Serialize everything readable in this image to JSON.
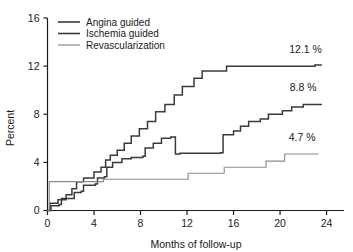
{
  "chart_data": {
    "type": "line",
    "subtype": "step-cumulative-event-curves",
    "title": "",
    "xlabel": "Months of follow-up",
    "ylabel": "Percent",
    "xlim": [
      0,
      25.5
    ],
    "ylim": [
      0,
      16
    ],
    "xticks": [
      0,
      4,
      8,
      12,
      16,
      20,
      24
    ],
    "yticks": [
      0,
      4,
      8,
      12,
      16
    ],
    "xtick_labels": [
      "0",
      "4",
      "8",
      "12",
      "16",
      "20",
      "24"
    ],
    "ytick_labels": [
      "0",
      "4",
      "8",
      "12",
      "16"
    ],
    "grid": false,
    "legend_position": "top-left-inside",
    "series": [
      {
        "name": "Angina guided",
        "color": "#3a3a3a",
        "width": 1.5,
        "endpoint_label": "12.1 %",
        "endpoint_value": 12.1,
        "points": [
          [
            0.0,
            0.0
          ],
          [
            0.2,
            0.6
          ],
          [
            0.9,
            0.9
          ],
          [
            1.6,
            1.3
          ],
          [
            2.1,
            1.8
          ],
          [
            2.5,
            2.4
          ],
          [
            3.1,
            2.7
          ],
          [
            4.0,
            3.2
          ],
          [
            4.6,
            3.6
          ],
          [
            5.0,
            4.2
          ],
          [
            5.4,
            4.6
          ],
          [
            6.0,
            5.0
          ],
          [
            6.6,
            5.6
          ],
          [
            7.2,
            6.2
          ],
          [
            7.9,
            6.8
          ],
          [
            8.6,
            7.4
          ],
          [
            9.3,
            8.2
          ],
          [
            10.1,
            8.8
          ],
          [
            10.9,
            9.6
          ],
          [
            11.6,
            10.3
          ],
          [
            12.6,
            11.0
          ],
          [
            13.3,
            11.6
          ],
          [
            15.3,
            11.6
          ],
          [
            15.4,
            12.0
          ],
          [
            22.6,
            12.0
          ],
          [
            23.0,
            12.1
          ],
          [
            23.6,
            12.1
          ]
        ]
      },
      {
        "name": "Ischemia guided",
        "color": "#3a3a3a",
        "width": 1.5,
        "endpoint_label": "8.8 %",
        "endpoint_value": 8.8,
        "points": [
          [
            0.0,
            0.0
          ],
          [
            0.3,
            0.4
          ],
          [
            1.0,
            0.5
          ],
          [
            1.2,
            1.0
          ],
          [
            2.2,
            1.0
          ],
          [
            2.3,
            1.5
          ],
          [
            2.9,
            1.6
          ],
          [
            3.1,
            2.1
          ],
          [
            4.1,
            2.2
          ],
          [
            4.3,
            2.7
          ],
          [
            4.9,
            2.8
          ],
          [
            5.1,
            3.6
          ],
          [
            5.6,
            4.0
          ],
          [
            6.4,
            4.3
          ],
          [
            7.2,
            4.4
          ],
          [
            8.2,
            4.5
          ],
          [
            8.4,
            5.2
          ],
          [
            9.1,
            5.6
          ],
          [
            9.8,
            6.0
          ],
          [
            10.6,
            6.1
          ],
          [
            11.0,
            4.7
          ],
          [
            11.4,
            4.75
          ],
          [
            14.9,
            4.8
          ],
          [
            15.1,
            6.3
          ],
          [
            16.0,
            6.6
          ],
          [
            16.6,
            7.0
          ],
          [
            17.3,
            7.4
          ],
          [
            18.3,
            7.6
          ],
          [
            19.0,
            8.0
          ],
          [
            20.2,
            8.3
          ],
          [
            21.0,
            8.6
          ],
          [
            22.0,
            8.8
          ],
          [
            23.6,
            8.8
          ]
        ]
      },
      {
        "name": "Revascularization",
        "color": "#8a8a8a",
        "width": 1.1,
        "endpoint_label": "4.7 %",
        "endpoint_value": 4.7,
        "points": [
          [
            0.0,
            0.0
          ],
          [
            0.15,
            2.4
          ],
          [
            4.6,
            2.4
          ],
          [
            4.8,
            2.6
          ],
          [
            9.6,
            2.6
          ],
          [
            11.9,
            2.6
          ],
          [
            12.1,
            3.1
          ],
          [
            15.0,
            3.1
          ],
          [
            15.2,
            3.6
          ],
          [
            18.6,
            3.6
          ],
          [
            18.8,
            4.1
          ],
          [
            20.2,
            4.1
          ],
          [
            20.4,
            4.7
          ],
          [
            23.3,
            4.7
          ]
        ]
      }
    ],
    "annotations": [
      {
        "text": "12.1 %",
        "x": 22.2,
        "y": 13.1,
        "series": "Angina guided"
      },
      {
        "text": "8.8 %",
        "x": 22.0,
        "y": 9.9,
        "series": "Ischemia guided"
      },
      {
        "text": "4.7 %",
        "x": 21.9,
        "y": 5.8,
        "series": "Revascularization"
      }
    ]
  },
  "legend": {
    "items": [
      {
        "label": "Angina guided",
        "color": "#3a3a3a",
        "width": 1.6
      },
      {
        "label": "Ischemia guided",
        "color": "#3a3a3a",
        "width": 1.6
      },
      {
        "label": "Revascularization",
        "color": "#8a8a8a",
        "width": 1.2
      }
    ]
  },
  "axes": {
    "x_title": "Months of follow-up",
    "y_title": "Percent"
  },
  "colors": {
    "axis": "#1a1a1a",
    "dark_series": "#3a3a3a",
    "light_series": "#8a8a8a",
    "background": "#ffffff"
  }
}
